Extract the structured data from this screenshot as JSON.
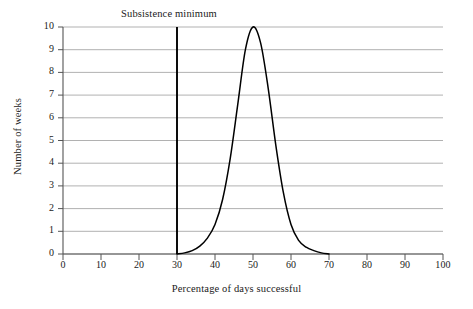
{
  "chart_data": {
    "type": "line",
    "title": "",
    "xlabel": "Percentage of days successful",
    "ylabel": "Number of weeks",
    "xlim": [
      0,
      100
    ],
    "ylim": [
      0,
      10
    ],
    "xticks": [
      0,
      10,
      20,
      30,
      40,
      50,
      60,
      70,
      80,
      90,
      100
    ],
    "yticks": [
      0,
      1,
      2,
      3,
      4,
      5,
      6,
      7,
      8,
      9,
      10
    ],
    "grid": "horizontal",
    "legend": "none",
    "series": [
      {
        "name": "Number of weeks",
        "color": "#000000",
        "x": [
          30,
          32,
          34,
          36,
          38,
          40,
          42,
          44,
          46,
          48,
          50,
          52,
          54,
          56,
          58,
          60,
          62,
          64,
          66,
          68,
          70
        ],
        "values": [
          0.0,
          0.05,
          0.15,
          0.35,
          0.7,
          1.3,
          2.4,
          4.2,
          6.6,
          9.0,
          10.0,
          9.3,
          7.3,
          4.8,
          2.7,
          1.3,
          0.6,
          0.3,
          0.15,
          0.05,
          0.0
        ]
      }
    ],
    "annotations": [
      {
        "type": "vline",
        "label": "Subsistence minimum",
        "x": 30,
        "color": "#000000"
      }
    ],
    "style": {
      "grid_color": "#a8a8a8",
      "axis_color": "#555555",
      "curve_color": "#000000",
      "background": "#ffffff"
    }
  },
  "axis": {
    "x_tick_labels": [
      "0",
      "10",
      "20",
      "30",
      "40",
      "50",
      "60",
      "70",
      "80",
      "90",
      "100"
    ],
    "y_tick_labels": [
      "0",
      "1",
      "2",
      "3",
      "4",
      "5",
      "6",
      "7",
      "8",
      "9",
      "10"
    ],
    "x_title": "Percentage of days successful",
    "y_title": "Number of weeks"
  },
  "annotation": {
    "subsistence_minimum": "Subsistence minimum"
  }
}
